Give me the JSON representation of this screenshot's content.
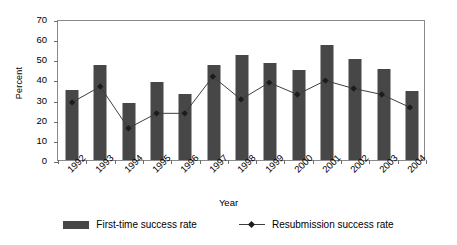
{
  "chart_data": {
    "type": "bar",
    "title": "",
    "xlabel": "Year",
    "ylabel": "Percent",
    "categories": [
      "1992",
      "1993",
      "1994",
      "1995",
      "1996",
      "1997",
      "1998",
      "1999",
      "2000",
      "2001",
      "2002",
      "2003",
      "2004"
    ],
    "ylim": [
      0,
      70
    ],
    "yticks": [
      0,
      10,
      20,
      30,
      40,
      50,
      60,
      70
    ],
    "grid": false,
    "legend_position": "bottom",
    "series": [
      {
        "name": "First-time success rate",
        "type": "bar",
        "color": "#474747",
        "values": [
          35,
          47,
          28.5,
          38.5,
          33,
          47,
          52,
          48,
          44.5,
          57,
          50,
          45,
          34.5
        ]
      },
      {
        "name": "Resubmission success rate",
        "type": "line",
        "color": "#3c3c3c",
        "marker": "diamond",
        "values": [
          29,
          37,
          16,
          23.5,
          23.5,
          42,
          30.5,
          39,
          33,
          40,
          36,
          33,
          26.5
        ]
      }
    ]
  },
  "legend": {
    "items": [
      {
        "label": "First-time success rate",
        "swatch": "bar-swatch"
      },
      {
        "label": "Resubmission success rate",
        "swatch": "line-swatch"
      }
    ]
  },
  "axes": {
    "y_title": "Percent",
    "x_title": "Year"
  }
}
